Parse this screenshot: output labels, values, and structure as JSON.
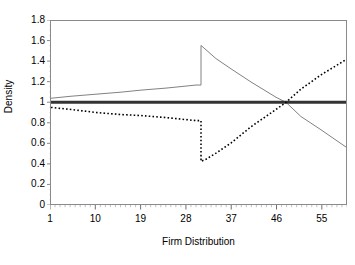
{
  "chart_data": {
    "type": "line",
    "title": "",
    "xlabel": "Firm Distribution",
    "ylabel": "Density",
    "xlim": [
      1,
      60
    ],
    "ylim": [
      0,
      1.8
    ],
    "grid": false,
    "legend": "none",
    "x_tick_labels": [
      "1",
      "10",
      "19",
      "28",
      "37",
      "46",
      "55"
    ],
    "x_tick_values": [
      1,
      10,
      19,
      28,
      37,
      46,
      55
    ],
    "y_tick_labels": [
      "0",
      "0.2",
      "0.4",
      "0.6",
      "0.8",
      "1",
      "1.2",
      "1.4",
      "1.6",
      "1.8"
    ],
    "y_tick_values": [
      0,
      0.2,
      0.4,
      0.6,
      0.8,
      1.0,
      1.2,
      1.4,
      1.6,
      1.8
    ],
    "series": [
      {
        "name": "solid-gray-density",
        "style": "solid",
        "color": "#808080",
        "width": 1,
        "x": [
          1,
          5,
          10,
          15,
          19,
          24,
          28,
          30,
          31,
          31,
          34,
          37,
          41,
          46,
          48,
          51,
          55,
          60
        ],
        "values": [
          1.04,
          1.06,
          1.08,
          1.1,
          1.12,
          1.14,
          1.16,
          1.17,
          1.17,
          1.56,
          1.43,
          1.33,
          1.2,
          1.05,
          1.0,
          0.86,
          0.73,
          0.56
        ]
      },
      {
        "name": "reference-line",
        "style": "solid",
        "color": "#333333",
        "width": 3,
        "x": [
          1,
          60
        ],
        "values": [
          1.0,
          1.0
        ]
      },
      {
        "name": "dotted-black-density",
        "style": "dotted",
        "color": "#000000",
        "width": 1.6,
        "x": [
          1,
          5,
          10,
          15,
          19,
          24,
          28,
          30,
          31,
          31,
          32,
          34,
          37,
          41,
          46,
          48,
          51,
          55,
          60
        ],
        "values": [
          0.95,
          0.93,
          0.9,
          0.88,
          0.87,
          0.85,
          0.83,
          0.82,
          0.82,
          0.42,
          0.44,
          0.5,
          0.6,
          0.76,
          0.93,
          1.0,
          1.13,
          1.27,
          1.42
        ]
      }
    ]
  },
  "axes": {
    "y_title": "Density",
    "x_title": "Firm Distribution"
  }
}
